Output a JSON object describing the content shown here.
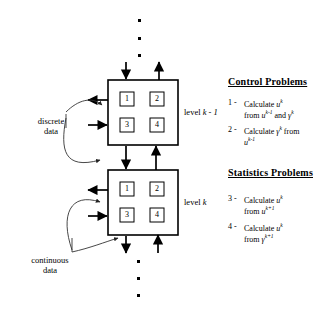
{
  "diagram": {
    "title_hidden": "",
    "levels": [
      {
        "id": "upper",
        "label_prefix": "level ",
        "label_var": "k - 1"
      },
      {
        "id": "lower",
        "label_prefix": "level ",
        "label_var": "k"
      }
    ],
    "cell_numbers": [
      "1",
      "2",
      "3",
      "4"
    ],
    "side_labels": [
      {
        "id": "discrete",
        "line1": "discrete",
        "line2": "data"
      },
      {
        "id": "continuous",
        "line1": "continuous",
        "line2": "data"
      }
    ],
    "ellipsis_dots": {
      "top_count": 3,
      "bottom_count": 3,
      "glyph": "▪"
    }
  },
  "legend": {
    "sections": [
      {
        "id": "control",
        "heading": "Control  Problems",
        "items": [
          {
            "number": "1 -",
            "line1_pre": "Calculate ",
            "line1_var": "u",
            "line1_sup": "k",
            "line2_pre": "from ",
            "line2_var": "u",
            "line2_sup": "k-1",
            "line2_mid": " and ",
            "line2_var2": "γ",
            "line2_sup2": "k"
          },
          {
            "number": "2 -",
            "line1_pre": "Calculate ",
            "line1_var": "γ",
            "line1_sup": "k",
            "line1_post": "  from",
            "line2_var": "u",
            "line2_sup": "k-1"
          }
        ]
      },
      {
        "id": "statistics",
        "heading": "Statistics Problems",
        "items": [
          {
            "number": "3 -",
            "line1_pre": "Calculate ",
            "line1_var": "u",
            "line1_sup": "k",
            "line2_pre": "from ",
            "line2_var": "u",
            "line2_sup": "k+1"
          },
          {
            "number": "4 -",
            "line1_pre": "Calculate ",
            "line1_var": "u",
            "line1_sup": "k",
            "line2_pre": "from ",
            "line2_var": "γ",
            "line2_sup": "k+1"
          }
        ]
      }
    ]
  },
  "colors": {
    "stroke": "#000000",
    "thin_stroke": "#333333",
    "background": "#ffffff"
  }
}
